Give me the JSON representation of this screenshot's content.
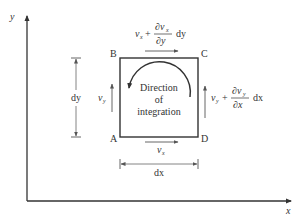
{
  "diagram": {
    "type": "fluid-element-circulation",
    "axes": {
      "x_label": "x",
      "y_label": "y"
    },
    "corners": {
      "A": "A",
      "B": "B",
      "C": "C",
      "D": "D"
    },
    "center_text": {
      "line1": "Direction",
      "line2": "of",
      "line3": "integration"
    },
    "velocities": {
      "bottom": {
        "base": "v",
        "sub": "x"
      },
      "left": {
        "base": "v",
        "sub": "y"
      },
      "top": {
        "base": "v",
        "sub": "x",
        "plus": " + ",
        "num": "∂v",
        "num_sub": "x",
        "den": "∂y",
        "tail": "dy"
      },
      "right": {
        "base": "v",
        "sub": "y",
        "plus": " + ",
        "num": "∂v",
        "num_sub": "y",
        "den": "∂x",
        "tail": "dx"
      }
    },
    "dimensions": {
      "height": "dy",
      "width": "dx"
    },
    "colors": {
      "stroke": "#333333",
      "light_stroke": "#666666",
      "background": "#ffffff"
    }
  }
}
